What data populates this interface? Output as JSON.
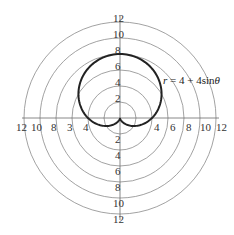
{
  "chart_data": {
    "type": "polar",
    "title": "",
    "equation_label": "r = 4 + 4sinθ",
    "equation": {
      "a": 4,
      "b": 4,
      "trig": "sin"
    },
    "rings": [
      2,
      4,
      6,
      8,
      10,
      12
    ],
    "rmax": 12,
    "grid": true,
    "axis_labels": {
      "up": [
        "2",
        "4",
        "6",
        "8",
        "10",
        "12"
      ],
      "down": [
        "2",
        "4",
        "6",
        "8",
        "10",
        "12"
      ],
      "left": [
        "4",
        "3",
        "8",
        "10",
        "12"
      ],
      "right": [
        "4",
        "6",
        "8",
        "10",
        "12"
      ]
    },
    "series": [
      {
        "name": "r = 4 + 4sinθ",
        "curve": "cardioid",
        "points_r_theta": [
          [
            4,
            0
          ],
          [
            6,
            30
          ],
          [
            7.46,
            60
          ],
          [
            8,
            90
          ],
          [
            7.46,
            120
          ],
          [
            6,
            150
          ],
          [
            4,
            180
          ],
          [
            2,
            210
          ],
          [
            0.54,
            240
          ],
          [
            0,
            270
          ],
          [
            0.54,
            300
          ],
          [
            2,
            330
          ],
          [
            4,
            360
          ]
        ]
      }
    ]
  },
  "colors": {
    "ring": "#8a8a8a",
    "axis": "#6a6a6a",
    "curve": "#222222",
    "text": "#333333"
  },
  "label": {
    "r": "r",
    "eq": " = 4 + 4sin",
    "theta": "θ"
  },
  "ticks": {
    "up_12": "12",
    "up_10": "10",
    "up_8": "8",
    "up_6": "6",
    "up_4": "4",
    "up_2": "2",
    "dn_2": "2",
    "dn_4": "4",
    "dn_6": "6",
    "dn_8": "8",
    "dn_10": "10",
    "dn_12": "12",
    "lf_12": "12",
    "lf_10": "10",
    "lf_8": "8",
    "lf_6": "3",
    "lf_4": "4",
    "rt_4": "4",
    "rt_6": "6",
    "rt_8": "8",
    "rt_10": "10",
    "rt_12": "12"
  }
}
